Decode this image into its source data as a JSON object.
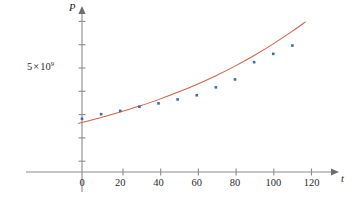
{
  "chart_data": {
    "type": "scatter",
    "title": "",
    "subtitle": "",
    "xlabel": "t",
    "ylabel": "P",
    "grid": false,
    "legend": "none",
    "xlim": [
      -10,
      128
    ],
    "ylim": [
      0,
      8.2
    ],
    "x_ticks": [
      0,
      20,
      40,
      60,
      80,
      100,
      120
    ],
    "x_tick_labels": [
      "0",
      "20",
      "40",
      "60",
      "80",
      "100",
      "120"
    ],
    "y_ticks": [
      1,
      2,
      3,
      4,
      5,
      6,
      7
    ],
    "y_tick_labels": [
      "",
      "",
      "",
      "",
      "5 × 10⁹",
      "",
      ""
    ],
    "y_labeled_tick": {
      "value": 5,
      "mantissa": "5",
      "multiplication_sign": "×",
      "base": "10",
      "exponent": "9",
      "text": "5 × 10⁹"
    },
    "units_note": "P in units of 1×10⁸ (y tick spacing = 1×10⁹)",
    "series": [
      {
        "name": "data-points",
        "type": "scatter",
        "color": "#3b6ea8",
        "marker": "square",
        "x": [
          0,
          10,
          20,
          30,
          40,
          50,
          60,
          70,
          80,
          90,
          100,
          110
        ],
        "y": [
          2.56,
          2.78,
          2.94,
          3.14,
          3.3,
          3.49,
          3.69,
          4.07,
          4.45,
          5.28,
          5.68,
          6.08
        ]
      },
      {
        "name": "exponential-model-curve",
        "type": "line",
        "color": "#d4614a",
        "equation_shape": "exponential",
        "x": [
          -2,
          0,
          10,
          20,
          30,
          40,
          50,
          60,
          70,
          80,
          90,
          100,
          110,
          117
        ],
        "y": [
          2.33,
          2.38,
          2.62,
          2.88,
          3.17,
          3.48,
          3.83,
          4.21,
          4.63,
          5.09,
          5.6,
          6.16,
          6.77,
          7.23
        ]
      }
    ]
  },
  "axes": {
    "y_axis_name": "P",
    "x_axis_name": "t"
  }
}
